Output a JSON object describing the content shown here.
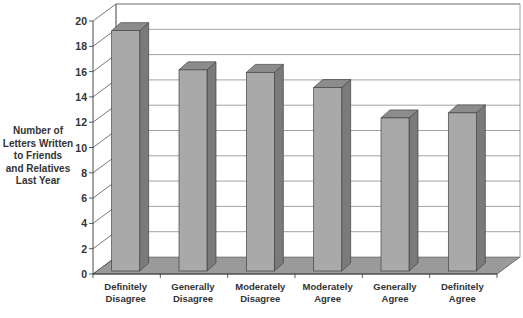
{
  "chart_data": {
    "type": "bar",
    "style": "3d",
    "title": "",
    "xlabel": "",
    "ylabel": "Number of\nLetters Written\nto Friends\nand Relatives\nLast Year",
    "categories": [
      "Definitely\nDisagree",
      "Generally\nDisagree",
      "Moderately\nDisagree",
      "Moderately\nAgree",
      "Generally\nAgree",
      "Definitely\nAgree"
    ],
    "values": [
      19.0,
      15.9,
      15.7,
      14.5,
      12.1,
      12.5
    ],
    "ylim": [
      0,
      20
    ],
    "yticks": [
      0,
      2,
      4,
      6,
      8,
      10,
      12,
      14,
      16,
      18,
      20
    ],
    "grid": true,
    "legend": "none",
    "colors": {
      "bar_front": "#a9a9a9",
      "bar_top": "#8c8c8c",
      "bar_side": "#7a7a7a",
      "floor": "#9a9a9a",
      "grid": "#8a8a8a",
      "text": "#333333"
    }
  }
}
